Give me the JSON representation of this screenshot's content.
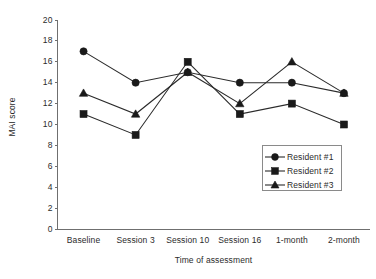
{
  "chart_data": {
    "type": "line",
    "title": "",
    "xlabel": "Time of assessment",
    "ylabel": "MAI score",
    "categories": [
      "Baseline",
      "Session 3",
      "Session 10",
      "Session 16",
      "1-month",
      "2-month"
    ],
    "ylim": [
      0,
      20
    ],
    "ytick_step": 2,
    "yticks": [
      "20",
      "18",
      "16",
      "14",
      "12",
      "10",
      "8",
      "6",
      "4",
      "2",
      "0"
    ],
    "grid": false,
    "legend_position": "inside-lower-right",
    "series": [
      {
        "name": "Resident #1",
        "marker": "circle",
        "color": "#1a1a1a",
        "values": [
          17,
          14,
          15,
          14,
          14,
          13
        ]
      },
      {
        "name": "Resident #2",
        "marker": "square",
        "color": "#1a1a1a",
        "values": [
          11,
          9,
          16,
          11,
          12,
          10
        ]
      },
      {
        "name": "Resident #3",
        "marker": "triangle",
        "color": "#1a1a1a",
        "values": [
          13,
          11,
          15,
          12,
          16,
          13
        ]
      }
    ]
  },
  "legend": {
    "entries": [
      {
        "label": "Resident #1",
        "marker": "circle"
      },
      {
        "label": "Resident #2",
        "marker": "square"
      },
      {
        "label": "Resident #3",
        "marker": "triangle"
      }
    ]
  }
}
